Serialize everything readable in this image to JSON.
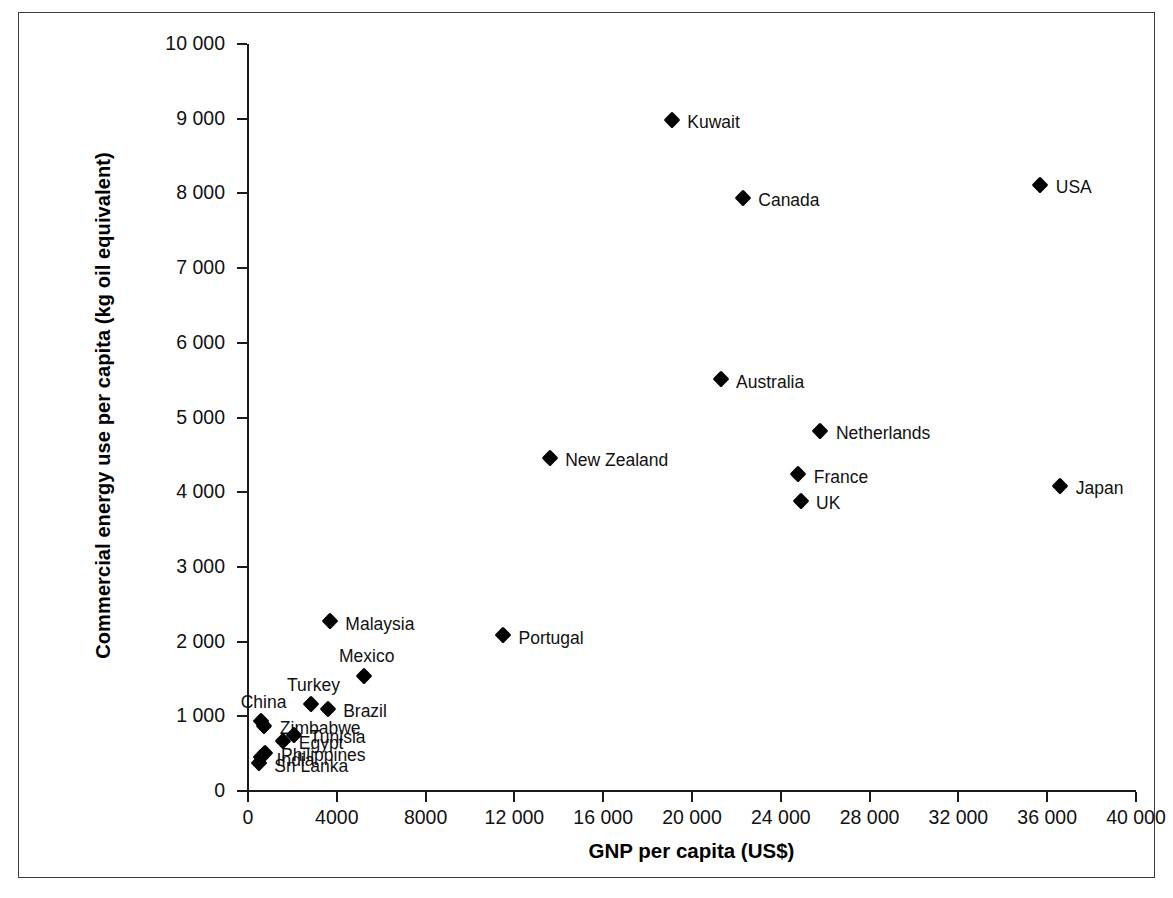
{
  "chart_data": {
    "type": "scatter",
    "title": "",
    "xlabel": "GNP per capita (US$)",
    "ylabel": "Commercial energy use per capita (kg oil equivalent)",
    "xlim": [
      0,
      40000
    ],
    "ylim": [
      0,
      10000
    ],
    "grid": false,
    "legend": "none",
    "xticks": [
      "0",
      "4000",
      "8000",
      "12 000",
      "16 000",
      "20 000",
      "24 000",
      "28 000",
      "32 000",
      "36 000",
      "40 000"
    ],
    "xtick_values": [
      0,
      4000,
      8000,
      12000,
      16000,
      20000,
      24000,
      28000,
      32000,
      36000,
      40000
    ],
    "yticks": [
      "0",
      "1 000",
      "2 000",
      "3 000",
      "4 000",
      "5 000",
      "6 000",
      "7 000",
      "8 000",
      "9 000",
      "10 000"
    ],
    "ytick_values": [
      0,
      1000,
      2000,
      3000,
      4000,
      5000,
      6000,
      7000,
      8000,
      9000,
      10000
    ],
    "points": [
      {
        "label": "Kuwait",
        "x": 19200,
        "y": 8950,
        "label_pos": "right"
      },
      {
        "label": "USA",
        "x": 35800,
        "y": 8080,
        "label_pos": "right"
      },
      {
        "label": "Canada",
        "x": 22400,
        "y": 7910,
        "label_pos": "right"
      },
      {
        "label": "Australia",
        "x": 21400,
        "y": 5480,
        "label_pos": "right"
      },
      {
        "label": "Netherlands",
        "x": 25900,
        "y": 4790,
        "label_pos": "right"
      },
      {
        "label": "New Zealand",
        "x": 13700,
        "y": 4430,
        "label_pos": "right"
      },
      {
        "label": "France",
        "x": 24900,
        "y": 4210,
        "label_pos": "right"
      },
      {
        "label": "Japan",
        "x": 36700,
        "y": 4050,
        "label_pos": "right"
      },
      {
        "label": "UK",
        "x": 25000,
        "y": 3850,
        "label_pos": "right"
      },
      {
        "label": "Malaysia",
        "x": 3800,
        "y": 2240,
        "label_pos": "right"
      },
      {
        "label": "Portugal",
        "x": 11600,
        "y": 2050,
        "label_pos": "right"
      },
      {
        "label": "Mexico",
        "x": 5350,
        "y": 1510,
        "label_pos": "above"
      },
      {
        "label": "Turkey",
        "x": 2950,
        "y": 1130,
        "label_pos": "above"
      },
      {
        "label": "Brazil",
        "x": 3700,
        "y": 1070,
        "label_pos": "right"
      },
      {
        "label": "China",
        "x": 700,
        "y": 900,
        "label_pos": "above"
      },
      {
        "label": "Zimbabwe",
        "x": 850,
        "y": 840,
        "label_pos": "right"
      },
      {
        "label": "Tunisia",
        "x": 2200,
        "y": 720,
        "label_pos": "right"
      },
      {
        "label": "Egypt",
        "x": 1700,
        "y": 640,
        "label_pos": "right"
      },
      {
        "label": "Philippines",
        "x": 900,
        "y": 480,
        "label_pos": "right"
      },
      {
        "label": "India",
        "x": 700,
        "y": 420,
        "label_pos": "right"
      },
      {
        "label": "Sri Lanka",
        "x": 600,
        "y": 340,
        "label_pos": "right"
      }
    ]
  }
}
